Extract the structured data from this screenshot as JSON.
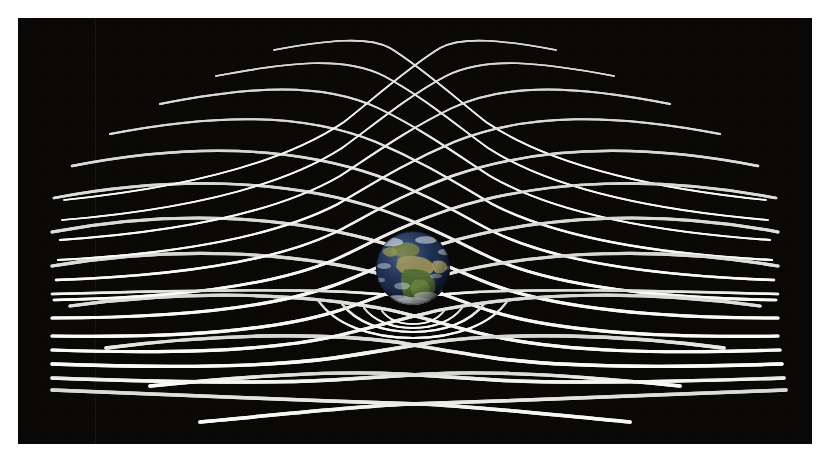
{
  "figure": {
    "alt_text": "A white grid representing the fabric of spacetime, stretched in perspective across a black background and warped downward into a gravity well by the Earth at its centre.",
    "subject": "Earth",
    "concept": "gravity well / warped spacetime fabric",
    "background_color": "#070605",
    "grid_color": "#f2f2f0",
    "border_color": "#ffffff",
    "plate": {
      "x": 18,
      "y": 18,
      "width": 794,
      "height": 426
    }
  },
  "grid": {
    "style": "diamond lattice in one-point perspective",
    "line_color": "#f2f2f0",
    "line_width_near": 3.1,
    "line_width_far": 1.6,
    "rows": 11,
    "columns": 13,
    "horizon_y": 272,
    "apex_top_y": 24,
    "apex_bottom_y": 404,
    "vanishing_center_x": 395
  },
  "well": {
    "center_x": 395,
    "center_y": 250,
    "radius": 112,
    "depth": 46,
    "description": "grid lines dip toward the mass at the centre forming a funnel"
  },
  "earth": {
    "center_x": 395,
    "center_y": 250,
    "radius": 37,
    "ocean_color": "#1d2f55",
    "deep_ocean_color": "#121d38",
    "land_color": "#5d6b38",
    "land_highlight": "#8a8f4e",
    "desert_color": "#9c9058",
    "cloud_color": "#e8eef4",
    "terminator_shadow": "#05070d",
    "visible_features": [
      "Africa",
      "Europe",
      "Arabian Peninsula",
      "Antarctic ice",
      "cloud bands"
    ]
  }
}
